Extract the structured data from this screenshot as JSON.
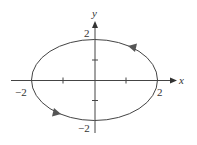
{
  "figure": {
    "type": "parametric-curve",
    "curve": "ellipse",
    "direction": "counterclockwise",
    "center": [
      0,
      0
    ],
    "semi_axis_x": 2,
    "semi_axis_y": 2,
    "colors": {
      "curve": "#444444",
      "axis": "#444444",
      "arrow": "#555555",
      "text": "#333333"
    }
  },
  "axes": {
    "x_label": "x",
    "y_label": "y",
    "x_ticks": [
      -2,
      -1,
      1,
      2
    ],
    "y_ticks": [
      -2,
      -1,
      1,
      2
    ]
  },
  "labels": {
    "x_neg": "−2",
    "x_pos": "2",
    "y_pos": "2",
    "y_neg": "−2"
  }
}
